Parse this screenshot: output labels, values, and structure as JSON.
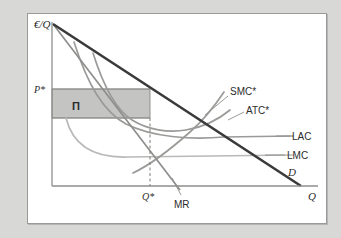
{
  "figure": {
    "type": "economics-diagram",
    "background_color": "#d8d8d6",
    "panel_color": "#ffffff",
    "panel_border_color": "#9a9a98"
  },
  "axes": {
    "y_label": "€/Q",
    "x_label": "Q",
    "axis_color": "#8e8e8c",
    "origin": {
      "x": 52,
      "y": 186
    },
    "x_end": 318,
    "y_top": 22
  },
  "marks": {
    "price_label": "P*",
    "quantity_label": "Q*",
    "profit_label": "Π",
    "profit_fill": "#c4c4c2",
    "profit_border": "#8a8a88",
    "price_line_y": 89,
    "cost_line_y": 118,
    "quantity_x": 150,
    "dashed_color": "#7d7d7b"
  },
  "curves": [
    {
      "name": "demand",
      "label": "D",
      "color": "#3a3a3a",
      "width": 2.6,
      "italic": true,
      "note": "straight downward sloping demand"
    },
    {
      "name": "marginal-revenue",
      "label": "MR",
      "color": "#8e8e8c",
      "width": 1.7,
      "italic": false,
      "note": "steeper straight line, twice the slope of demand"
    },
    {
      "name": "short-run-marginal-cost",
      "label": "SMC*",
      "color": "#9a9a98",
      "width": 1.7,
      "italic": false,
      "note": "rising through Q* where it cuts MR"
    },
    {
      "name": "short-run-average-total-cost",
      "label": "ATC*",
      "color": "#9a9a98",
      "width": 1.7,
      "italic": false,
      "note": "U-shaped, tangent to LAC at Q*"
    },
    {
      "name": "long-run-average-cost",
      "label": "LAC",
      "color": "#9a9a98",
      "width": 1.7,
      "italic": false,
      "note": "falling then flattening"
    },
    {
      "name": "long-run-marginal-cost",
      "label": "LMC",
      "color": "#b0b0ae",
      "width": 1.7,
      "italic": false,
      "note": "falling then horizontal"
    }
  ],
  "labels": {
    "y_axis": "€/Q",
    "x_axis": "Q",
    "price": "P*",
    "quantity": "Q*",
    "profit": "Π",
    "demand": "D",
    "marginal_revenue": "MR",
    "smc": "SMC*",
    "atc": "ATC*",
    "lac": "LAC",
    "lmc": "LMC"
  }
}
